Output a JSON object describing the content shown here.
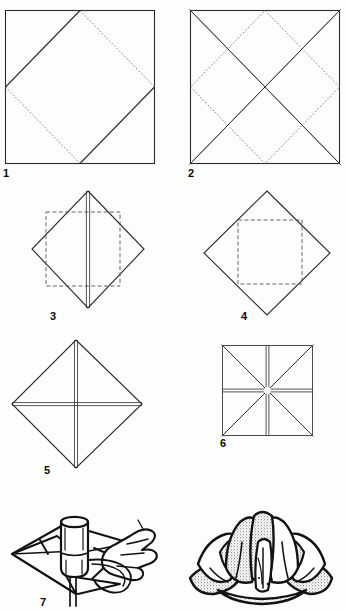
{
  "document": {
    "title": "Origami Lotus Flower — Folding Instructions",
    "masthead_fragment": "",
    "page_background": "#fdfdfc",
    "ink_color": "#121212",
    "line_color": "#2b2b2b",
    "fold_line_color": "#6f6f6f"
  },
  "steps": [
    {
      "number": "1",
      "name": "square-with-inscribed-diamond",
      "caption": "",
      "shape": "square",
      "solid_edges": [
        "top-left-to-top-mid",
        "left-mid-to-top-mid",
        "right-mid-to-bottom-mid",
        "bottom-mid-to-right-mid"
      ],
      "dotted_edges": [
        "top-mid-to-right-mid",
        "left-mid-to-bottom-mid"
      ]
    },
    {
      "number": "2",
      "name": "square-with-both-diagonals-and-diamond",
      "caption": "",
      "shape": "square",
      "double_lines": [
        "diagonal-tl-br",
        "diagonal-tr-bl"
      ],
      "dotted_edges": [
        "inscribed-diamond-four-sides"
      ]
    },
    {
      "number": "3",
      "name": "diamond-with-inner-square-and-center-fold",
      "caption": "",
      "shape": "diamond",
      "dashed_shapes": [
        "inner-square"
      ],
      "double_lines": [
        "vertical-center"
      ]
    },
    {
      "number": "4",
      "name": "diamond-with-inner-square",
      "caption": "",
      "shape": "diamond",
      "dashed_shapes": [
        "inner-square"
      ],
      "double_lines": []
    },
    {
      "number": "5",
      "name": "diamond-with-cross-folds",
      "caption": "",
      "shape": "diamond",
      "double_lines": [
        "vertical-center",
        "horizontal-center"
      ]
    },
    {
      "number": "6",
      "name": "square-with-eight-point-star-folds",
      "caption": "",
      "shape": "square",
      "double_lines": [
        "diagonal-tl-br",
        "diagonal-tr-bl",
        "vertical-center",
        "horizontal-center"
      ]
    },
    {
      "number": "7",
      "name": "hand-shaping-petals-over-glass",
      "caption": "",
      "shape": "perspective-illustration",
      "elements": [
        "folded-paper-base",
        "cylindrical-glass",
        "hand-pulling-petal"
      ]
    }
  ],
  "result": {
    "number": "",
    "name": "finished-lotus-flower",
    "caption": "",
    "description": "finished water lily / lotus blossom"
  }
}
